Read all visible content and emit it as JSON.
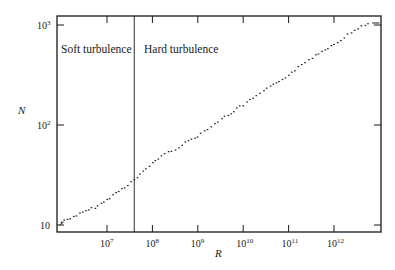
{
  "chart_data": {
    "type": "scatter",
    "title": "",
    "xlabel": "R",
    "ylabel": "N",
    "xscale": "log",
    "yscale": "log",
    "xlim_log10": [
      5.9,
      13.04
    ],
    "ylim_log10": [
      0.93,
      3.09
    ],
    "grid": false,
    "legend": null,
    "x_ticks": [
      {
        "log": 7,
        "label_base": "10",
        "label_exp": "7"
      },
      {
        "log": 8,
        "label_base": "10",
        "label_exp": "8"
      },
      {
        "log": 9,
        "label_base": "10",
        "label_exp": "9"
      },
      {
        "log": 10,
        "label_base": "10",
        "label_exp": "10"
      },
      {
        "log": 11,
        "label_base": "10",
        "label_exp": "11"
      },
      {
        "log": 12,
        "label_base": "10",
        "label_exp": "12"
      }
    ],
    "y_ticks": [
      {
        "log": 1,
        "label_base": "10",
        "label_exp": ""
      },
      {
        "log": 2,
        "label_base": "10",
        "label_exp": "2"
      },
      {
        "log": 3,
        "label_base": "10",
        "label_exp": "3"
      }
    ],
    "divider": {
      "x_log10": 7.6,
      "description": "Transition between soft and hard turbulence (R ≈ 4×10^7)"
    },
    "annotations": [
      {
        "text": "Soft turbulence",
        "position": "left of divider, top"
      },
      {
        "text": "Hard turbulence",
        "position": "right of divider, top"
      }
    ],
    "series": [
      {
        "name": "N vs R",
        "log10_points": [
          [
            6.0,
            1.03
          ],
          [
            6.2,
            1.07
          ],
          [
            6.4,
            1.11
          ],
          [
            6.6,
            1.15
          ],
          [
            6.8,
            1.19
          ],
          [
            7.0,
            1.25
          ],
          [
            7.2,
            1.32
          ],
          [
            7.4,
            1.38
          ],
          [
            7.6,
            1.45
          ],
          [
            7.8,
            1.53
          ],
          [
            8.0,
            1.62
          ],
          [
            8.2,
            1.69
          ],
          [
            8.5,
            1.76
          ],
          [
            8.8,
            1.84
          ],
          [
            9.0,
            1.89
          ],
          [
            9.3,
            1.99
          ],
          [
            9.6,
            2.08
          ],
          [
            10.0,
            2.2
          ],
          [
            10.3,
            2.29
          ],
          [
            10.6,
            2.38
          ],
          [
            11.0,
            2.5
          ],
          [
            11.3,
            2.6
          ],
          [
            11.6,
            2.7
          ],
          [
            12.0,
            2.81
          ],
          [
            12.3,
            2.9
          ],
          [
            12.6,
            2.99
          ],
          [
            12.84,
            3.02
          ],
          [
            13.0,
            3.02
          ]
        ],
        "approx_values": [
          {
            "R": "1e6",
            "N": 11
          },
          {
            "R": "1e7",
            "N": 18
          },
          {
            "R": "4e7",
            "N": 28
          },
          {
            "R": "1e8",
            "N": 42
          },
          {
            "R": "1e9",
            "N": 78
          },
          {
            "R": "1e10",
            "N": 160
          },
          {
            "R": "1e11",
            "N": 320
          },
          {
            "R": "1e12",
            "N": 650
          },
          {
            "R": "7e12",
            "N": 1050
          }
        ]
      }
    ]
  },
  "labels": {
    "soft": "Soft turbulence",
    "hard": "Hard turbulence",
    "x_axis": "R",
    "y_axis": "N"
  },
  "colors": {
    "ink": "#1a1a1a",
    "background": "#ffffff"
  }
}
